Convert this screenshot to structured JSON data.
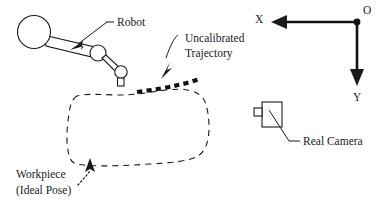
{
  "figure": {
    "title_present": false,
    "background_color": "#ffffff",
    "ink_color": "#1a1a1a",
    "width": 381,
    "height": 208
  },
  "labels": {
    "robot": "Robot",
    "uncalibrated_trajectory_line1": "Uncalibrated",
    "uncalibrated_trajectory_line2": "Trajectory",
    "workpiece_line1": "Workpiece",
    "workpiece_line2": "(Ideal Pose)",
    "real_camera": "Real Camera",
    "axis_x": "X",
    "axis_y": "Y",
    "origin": "O"
  },
  "elements": {
    "robot": {
      "name": "robot-manipulator",
      "parts": [
        "base-circle",
        "upper-link",
        "elbow-joint",
        "forearm-link",
        "wrist-joint",
        "end-effector"
      ]
    },
    "workpiece": {
      "name": "workpiece-ideal-pose",
      "style": "dashed-outline",
      "dash_pattern": "6 5"
    },
    "trajectory": {
      "name": "uncalibrated-trajectory",
      "style": "thick-dotted",
      "dash_pattern": "5.2 4.2",
      "stroke_width": 4.2
    },
    "camera": {
      "name": "real-camera",
      "parts": [
        "camera-body",
        "camera-lens"
      ]
    },
    "coordinate_frame": {
      "name": "world-coordinate-frame",
      "origin_marker": "filled-dot",
      "x_direction": "left",
      "y_direction": "down"
    }
  }
}
